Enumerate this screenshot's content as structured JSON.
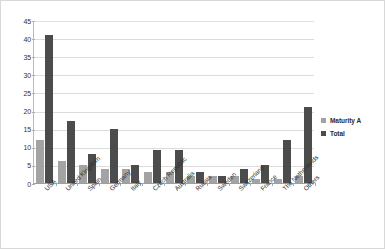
{
  "chart_data": {
    "type": "bar",
    "title": "",
    "subtitle": "",
    "xlabel": "",
    "ylabel": "",
    "ylim": [
      0,
      45
    ],
    "yticks": [
      0,
      5,
      10,
      15,
      20,
      25,
      30,
      35,
      40,
      45
    ],
    "grid": "horizontal",
    "legend_position": "right",
    "categories": [
      "USA",
      "United Kingdom",
      "Spain",
      "Germany",
      "Italy",
      "Czech Republic",
      "Australia",
      "Russia",
      "Sweden",
      "Switzerland",
      "France",
      "The Netherlands",
      "Others"
    ],
    "series": [
      {
        "name": "Maturity A",
        "color": "#a3a3a3",
        "values": [
          12,
          6,
          5,
          4,
          4,
          3,
          3,
          2,
          2,
          2,
          1,
          1,
          2
        ]
      },
      {
        "name": "Total",
        "color": "#4c4c4c",
        "values": [
          41,
          17,
          8,
          15,
          5,
          9,
          9,
          3,
          2,
          4,
          5,
          12,
          21
        ]
      }
    ]
  },
  "legend": {
    "entries": [
      {
        "label": "Maturity A"
      },
      {
        "label": "Total"
      }
    ]
  },
  "colors": {
    "series_maturity_a": "#a3a3a3",
    "series_total": "#4c4c4c",
    "gridline": "#dcdcdc",
    "axis": "#9e9e9e",
    "border": "#d8d8d8",
    "background": "#ffffff"
  }
}
